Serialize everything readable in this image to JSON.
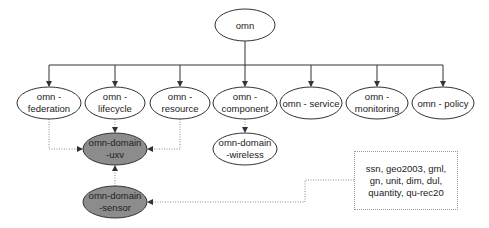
{
  "colors": {
    "line": "#333333",
    "dotted_line": "#8a8a8a",
    "node_fill": "#ffffff",
    "highlight_fill": "#8c8c8c",
    "text": "#222222"
  },
  "root": {
    "label": "omn"
  },
  "modules": [
    {
      "line1": "omn -",
      "line2": "federation"
    },
    {
      "line1": "omn -",
      "line2": "lifecycle"
    },
    {
      "line1": "omn -",
      "line2": "resource"
    },
    {
      "line1": "omn -",
      "line2": "component"
    },
    {
      "line1": "omn - service",
      "line2": ""
    },
    {
      "line1": "omn -",
      "line2": "monitoring"
    },
    {
      "line1": "omn - policy",
      "line2": ""
    }
  ],
  "domains": {
    "uxv": {
      "line1": "omn-domain",
      "line2": "-uxv",
      "highlighted": true
    },
    "wireless": {
      "line1": "omn-domain",
      "line2": "-wireless",
      "highlighted": false
    },
    "sensor": {
      "line1": "omn-domain",
      "line2": "-sensor",
      "highlighted": true
    }
  },
  "external_ontologies": {
    "text": "ssn, geo2003, gml, gn, unit, dim, dul, quantity, qu-rec20"
  }
}
